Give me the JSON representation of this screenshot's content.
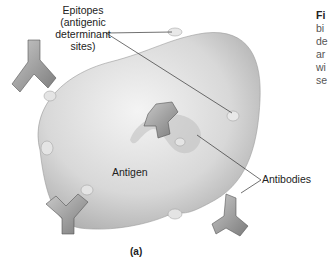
{
  "figure": {
    "labels": {
      "epitopes": [
        "Epitopes",
        "(antigenic",
        "determinant",
        "sites)"
      ],
      "antigen": "Antigen",
      "antibodies": "Antibodies",
      "panel": "(a)"
    },
    "caption_fragment": {
      "title": "Fi",
      "lines": [
        "bi",
        "de",
        "ar",
        "wi",
        "se"
      ]
    }
  }
}
